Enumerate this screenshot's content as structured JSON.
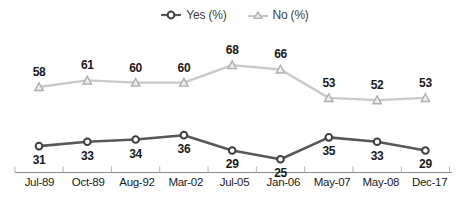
{
  "chart_data": {
    "type": "line",
    "title": "",
    "subtitle": "",
    "xlabel": "",
    "ylabel": "",
    "grid": false,
    "legend_position": "top-center",
    "ylim": [
      0,
      80
    ],
    "categories": [
      "Jul-89",
      "Oct-89",
      "Aug-92",
      "Mar-02",
      "Jul-05",
      "Jan-06",
      "May-07",
      "May-08",
      "Dec-17"
    ],
    "series": [
      {
        "name": "Yes (%)",
        "marker": "circle",
        "color": "#58585a",
        "label_position": "below",
        "values": [
          31,
          33,
          34,
          36,
          29,
          25,
          35,
          33,
          29
        ]
      },
      {
        "name": "No (%)",
        "marker": "triangle",
        "color": "#bdbdbd",
        "label_position": "above",
        "values": [
          58,
          61,
          60,
          60,
          68,
          66,
          53,
          52,
          53
        ]
      }
    ]
  },
  "legend": {
    "entries": [
      {
        "label": "Yes (%)",
        "icon": "circle-marker-icon",
        "color": "#58585a"
      },
      {
        "label": "No (%)",
        "icon": "triangle-marker-icon",
        "color": "#bdbdbd"
      }
    ]
  },
  "axis": {
    "line_color": "#8a8a8a",
    "tick_color": "#b5b5b5"
  }
}
